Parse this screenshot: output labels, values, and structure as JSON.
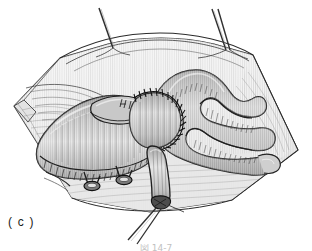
{
  "figure": {
    "panel_label": "( c )",
    "figure_number_partial": "図 14-7",
    "background_color": "#ffffff",
    "ink_color": "#1a1a1a",
    "tissue_fill_light": "#f2f2f2",
    "tissue_fill_mid": "#d8d8d8",
    "tissue_fill_dark": "#a8a8a8",
    "vessel_fill": "#c4c4c4",
    "shadow_color": "#6e6e6e",
    "suture_color": "#2a2a2a",
    "style": "grayscale pen-and-ink medical line drawing with vertical hatching"
  },
  "elements": {
    "tissue_field_label": "Retracted tissue field",
    "left_stay_suture_label": "Left stay suture thread",
    "right_stay_suture_label": "Right stay suture thread",
    "bottom_tie_suture_label": "Ligated stump tie suture",
    "anastomosis_label": "Circular running anastomosis suture line",
    "graft_vessel_label": "Anastomosed graft vessel",
    "branch_vessel_label": "Branching vessel trunk",
    "small_branch_label": "Small side branch",
    "clip_one_label": "Surgical clip",
    "clip_two_label": "Surgical clip",
    "stump_label": "Ligated vessel stump"
  }
}
